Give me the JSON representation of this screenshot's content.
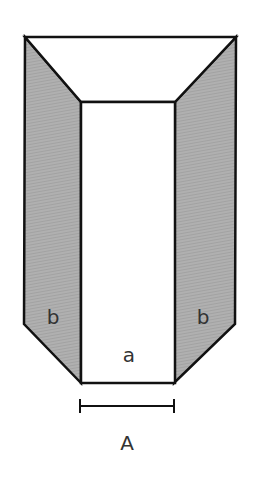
{
  "diagram": {
    "type": "prism-net",
    "labels": {
      "left_face": "b",
      "right_face": "b",
      "center_face": "a",
      "dimension": "A"
    },
    "colors": {
      "stroke": "#111111",
      "side_fill": "#a8a8a8",
      "center_fill": "#ffffff",
      "top_fill": "#ffffff",
      "label": "#333333"
    }
  }
}
